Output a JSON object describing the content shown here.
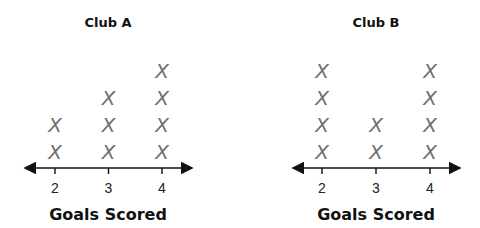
{
  "chart_data": [
    {
      "type": "scatter",
      "subtype": "dot-plot",
      "title": "Club A",
      "xlabel": "Goals Scored",
      "ylabel": "",
      "categories": [
        2,
        3,
        4
      ],
      "tick_labels": [
        "2",
        "3",
        "4"
      ],
      "values": [
        2,
        3,
        4
      ],
      "mark_symbol": "X",
      "mark_color": "#6e6e6e",
      "grid": false
    },
    {
      "type": "scatter",
      "subtype": "dot-plot",
      "title": "Club B",
      "xlabel": "Goals Scored",
      "ylabel": "",
      "categories": [
        2,
        3,
        4
      ],
      "tick_labels": [
        "2",
        "3",
        "4"
      ],
      "values": [
        4,
        2,
        4
      ],
      "mark_symbol": "X",
      "mark_color": "#6e6e6e",
      "grid": false
    }
  ]
}
